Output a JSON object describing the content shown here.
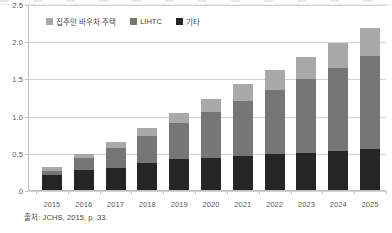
{
  "chart_data": {
    "type": "bar",
    "stacked": true,
    "title": "",
    "xlabel": "",
    "ylabel": "",
    "grid": true,
    "legend_position": "top-left",
    "categories": [
      "2015",
      "2016",
      "2017",
      "2018",
      "2019",
      "2020",
      "2021",
      "2022",
      "2023",
      "2024",
      "2025"
    ],
    "ylim": [
      0,
      2.5
    ],
    "yticks": [
      0,
      0.5,
      1.0,
      1.5,
      2.0,
      2.5
    ],
    "ytick_labels": [
      "0",
      "0.5",
      "1.0",
      "1.5",
      "2.0",
      "2.5"
    ],
    "series": [
      {
        "name": "기타",
        "key": "other",
        "color": "#262626",
        "values": [
          0.2,
          0.27,
          0.3,
          0.36,
          0.42,
          0.43,
          0.46,
          0.48,
          0.5,
          0.52,
          0.55
        ]
      },
      {
        "name": "LIHTC",
        "key": "lihtc",
        "color": "#767676",
        "values": [
          0.05,
          0.16,
          0.26,
          0.36,
          0.48,
          0.62,
          0.74,
          0.87,
          0.99,
          1.12,
          1.25
        ]
      },
      {
        "name": "집주인 바우처 주택",
        "key": "voucher",
        "color": "#a9a9a9",
        "values": [
          0.06,
          0.05,
          0.09,
          0.12,
          0.14,
          0.17,
          0.23,
          0.26,
          0.3,
          0.33,
          0.38
        ]
      }
    ],
    "totals": [
      0.31,
      0.48,
      0.65,
      0.84,
      1.04,
      1.22,
      1.43,
      1.61,
      1.79,
      1.97,
      2.18
    ]
  },
  "legend": {
    "items": [
      {
        "label": "집주인 바우처 주택",
        "swatch_class": "sw-voucher",
        "icon": "legend-swatch-voucher"
      },
      {
        "label": "LIHTC",
        "swatch_class": "sw-lihtc",
        "icon": "legend-swatch-lihtc"
      },
      {
        "label": "기타",
        "swatch_class": "sw-other",
        "icon": "legend-swatch-other"
      }
    ]
  },
  "source": {
    "text": "출처: JCHS, 2015, p. 33."
  }
}
